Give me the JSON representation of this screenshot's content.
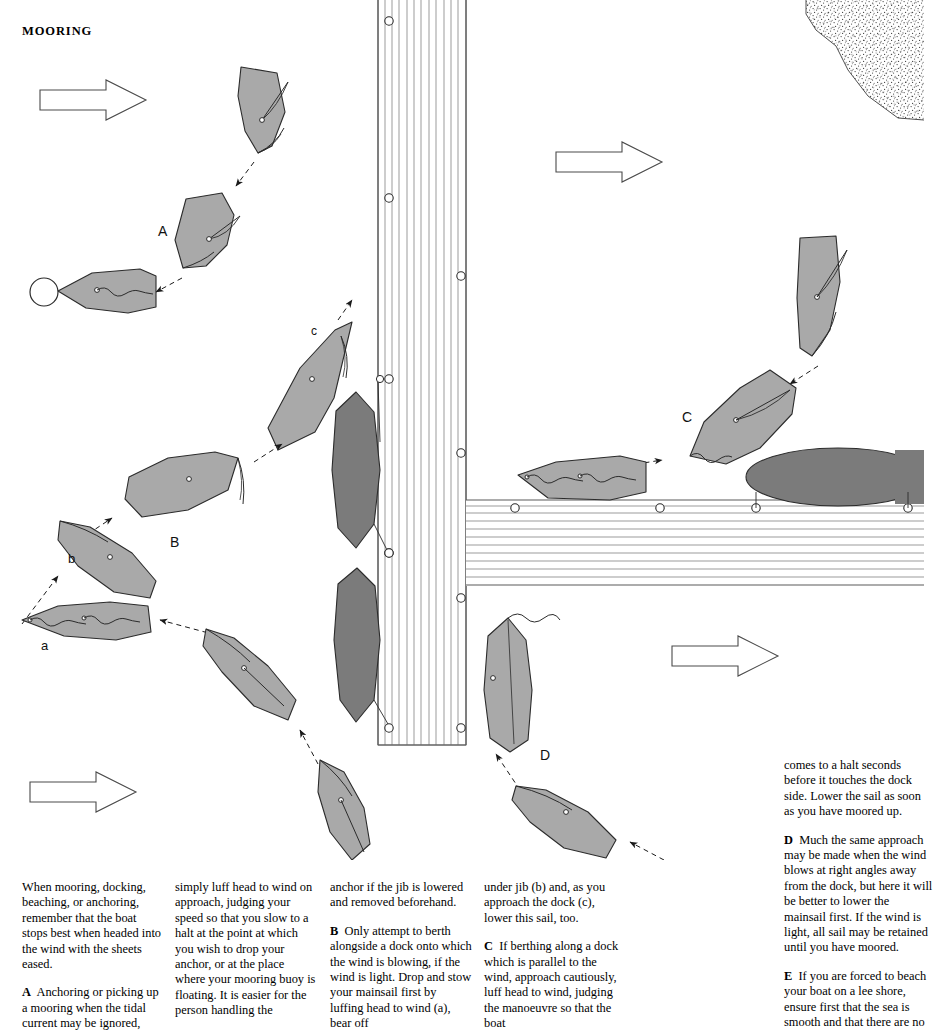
{
  "page": {
    "title": "MOORING",
    "width": 924,
    "height": 1015
  },
  "colors": {
    "hull_light": "#a9a9a9",
    "hull_dark": "#7b7b7b",
    "line": "#2b2b2b",
    "dock_line": "#6f6f6f",
    "background": "#ffffff",
    "shore_stipple": "#3a3a3a"
  },
  "diagram": {
    "caption_labels": [
      {
        "id": "label-A",
        "text": "A",
        "x": 158,
        "y": 232
      },
      {
        "id": "label-B",
        "text": "B",
        "x": 170,
        "y": 543
      },
      {
        "id": "label-C",
        "text": "C",
        "x": 684,
        "y": 418
      },
      {
        "id": "label-D",
        "text": "D",
        "x": 543,
        "y": 756
      },
      {
        "id": "label-a",
        "text": "a",
        "x": 43,
        "y": 645
      },
      {
        "id": "label-b",
        "text": "b",
        "x": 71,
        "y": 559
      },
      {
        "id": "label-c",
        "text": "c",
        "x": 314,
        "y": 331
      }
    ],
    "wind_arrows": [
      {
        "id": "wind-arrow-top-left",
        "x": 40,
        "y": 80,
        "w": 106,
        "h": 40
      },
      {
        "id": "wind-arrow-top-right",
        "x": 556,
        "y": 142,
        "w": 106,
        "h": 40
      },
      {
        "id": "wind-arrow-bottom-left",
        "x": 30,
        "y": 772,
        "w": 106,
        "h": 40
      },
      {
        "id": "wind-arrow-bottom-right",
        "x": 672,
        "y": 636,
        "w": 106,
        "h": 40
      }
    ],
    "elements": {
      "mooring_buoy": "circle at far left of sequence A",
      "vertical_dock": "planked pier running top to bottom, x 378-466",
      "horizontal_dock": "planked quay running left to right at y 500-585",
      "shore": "stippled sand bank, top right corner"
    }
  },
  "captions": {
    "col1": [
      {
        "lead": "",
        "text": "When mooring, docking, beaching, or anchoring, remember that the boat stops best when headed into the wind with the sheets eased."
      },
      {
        "lead": "A",
        "text": "Anchoring or picking up a mooring when the tidal current may be ignored,"
      }
    ],
    "col2": [
      {
        "lead": "",
        "text": "simply luff head to wind on approach, judging your speed so that you slow to a halt at the point at which you wish to drop your anchor, or at the place where your mooring buoy is floating. It is easier for the person handling the"
      }
    ],
    "col3": [
      {
        "lead": "",
        "text": "anchor if the jib is lowered and removed beforehand."
      },
      {
        "lead": "B",
        "text": "Only attempt to berth alongside a dock onto which the wind is blowing, if the wind is light. Drop and stow your mainsail first by luffing head to wind (a), bear off"
      }
    ],
    "col4": [
      {
        "lead": "",
        "text": "under jib (b) and, as you approach the dock (c), lower this sail, too."
      },
      {
        "lead": "C",
        "text": "If berthing along a dock which is parallel to the wind, approach cautiously, luff head to wind, judging the manoeuvre so that the boat"
      }
    ],
    "col5": [
      {
        "lead": "",
        "text": "comes to a halt seconds before it touches the dock side. Lower the sail as soon as you have moored up."
      },
      {
        "lead": "D",
        "text": "Much the same approach may be made when the wind blows at right angles away from the dock, but here it will be better to lower the mainsail first. If the wind is light, all sail may be retained until you have moored."
      },
      {
        "lead": "E",
        "text": "If you are forced to beach your boat on a lee shore, ensure first that the sea is smooth and that there are no"
      }
    ]
  }
}
